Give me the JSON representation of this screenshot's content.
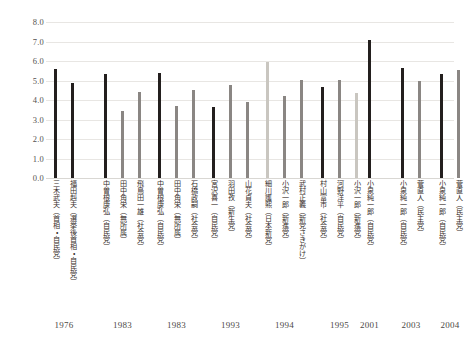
{
  "chart_data": {
    "type": "bar",
    "title": "",
    "subtitle": "",
    "xlabel": "",
    "ylabel": "",
    "ylim": [
      0.0,
      8.0
    ],
    "ytick_step": 1.0,
    "ytick_labels": [
      "8.0",
      "7.0",
      "6.0",
      "5.0",
      "4.0",
      "3.0",
      "2.0",
      "1.0",
      "0.0"
    ],
    "ytick_values": [
      8.0,
      7.0,
      6.0,
      5.0,
      4.0,
      3.0,
      2.0,
      1.0,
      0.0
    ],
    "grid": true,
    "grid_axis": "y",
    "legend": "none",
    "legend_position": "none",
    "orientation": "vertical",
    "categories": [
      "1976",
      "1983",
      "1983",
      "1993",
      "1994",
      "1995",
      "2001",
      "2003",
      "2004"
    ],
    "colors": {
      "dark": "#231f1e",
      "mid": "#8a8683",
      "light": "#c9c6c0",
      "gridline": "#e8e6e3",
      "text": "#39302c",
      "axis_text": "#555250",
      "background": "#ffffff"
    },
    "groups": [
      {
        "year": "1976",
        "bars": [
          {
            "label": "三木武夫（首相・自民党）",
            "value": 5.6,
            "shade": "dark"
          },
          {
            "label": "福田赳夫（選挙後首相・自民党）",
            "value": 4.85,
            "shade": "dark"
          }
        ]
      },
      {
        "year": "1983",
        "bars": [
          {
            "label": "中曽根康弘（自民党）",
            "value": 5.35,
            "shade": "dark"
          },
          {
            "label": "田中角栄（無所属）",
            "value": 3.45,
            "shade": "mid"
          },
          {
            "label": "飛鳥田一雄（社会党）",
            "value": 4.4,
            "shade": "mid"
          }
        ]
      },
      {
        "year": "1983",
        "bars": [
          {
            "label": "中曽根康弘（自民党）",
            "value": 5.4,
            "shade": "dark"
          },
          {
            "label": "田中角栄（無所属）",
            "value": 3.7,
            "shade": "mid"
          },
          {
            "label": "石橋政嗣（社会党）",
            "value": 4.5,
            "shade": "mid"
          }
        ]
      },
      {
        "year": "1993",
        "bars": [
          {
            "label": "宮沢喜一（自民党）",
            "value": 3.65,
            "shade": "dark"
          },
          {
            "label": "羽田孜（新生党）",
            "value": 4.75,
            "shade": "mid"
          },
          {
            "label": "山花貞夫（社会党）",
            "value": 3.9,
            "shade": "mid"
          }
        ]
      },
      {
        "year": "1994",
        "bars": [
          {
            "label": "細川護熙（日本新党）",
            "value": 5.95,
            "shade": "light"
          },
          {
            "label": "小沢一郎（新進党）",
            "value": 4.2,
            "shade": "mid"
          },
          {
            "label": "武村正義（新党さきがけ）",
            "value": 5.05,
            "shade": "mid"
          }
        ]
      },
      {
        "year": "1995",
        "bars": [
          {
            "label": "村山富市（社会党）",
            "value": 4.65,
            "shade": "dark"
          },
          {
            "label": "河野洋平（自民党）",
            "value": 5.05,
            "shade": "mid"
          },
          {
            "label": "小沢一郎（新進党）",
            "value": 4.35,
            "shade": "light"
          }
        ]
      },
      {
        "year": "2001",
        "bars": [
          {
            "label": "小泉純一郎（自民党）",
            "value": 7.1,
            "shade": "dark"
          }
        ]
      },
      {
        "year": "2003",
        "bars": [
          {
            "label": "小泉純一郎（自民党）",
            "value": 5.65,
            "shade": "dark"
          },
          {
            "label": "菅直人（民主党）",
            "value": 5.0,
            "shade": "mid"
          }
        ]
      },
      {
        "year": "2004",
        "bars": [
          {
            "label": "小泉純一郎（自民党）",
            "value": 5.35,
            "shade": "dark"
          },
          {
            "label": "菅直人（民主党）",
            "value": 5.55,
            "shade": "mid"
          }
        ]
      }
    ]
  }
}
